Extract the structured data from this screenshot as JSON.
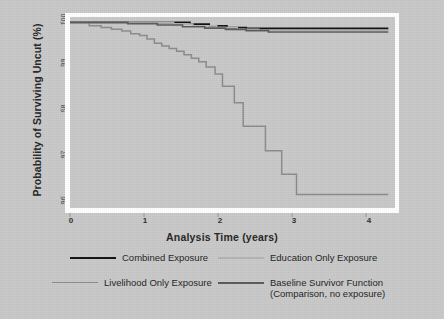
{
  "chart_data": {
    "type": "line",
    "title": "",
    "xlabel": "Analysis Time (years)",
    "ylabel": "Probability of Surviving Uncut (%)",
    "xlim": [
      0,
      4.35
    ],
    "ylim": [
      95.75,
      100.1
    ],
    "xticks": [
      "0",
      "1",
      "2",
      "3",
      "4"
    ],
    "xtick_values": [
      0,
      1,
      2,
      3,
      4
    ],
    "yticks": [
      "96",
      "97",
      "98",
      "99",
      "100"
    ],
    "ytick_values": [
      96,
      97,
      98,
      99,
      100
    ],
    "grid": false,
    "legend_position": "below",
    "step_style": "post",
    "series": [
      {
        "name": "Combined Exposure",
        "color": "#111111",
        "width": 1.8,
        "points": [
          [
            0.0,
            100.0
          ],
          [
            1.55,
            100.0
          ],
          [
            1.62,
            99.96
          ],
          [
            1.8,
            99.96
          ],
          [
            1.88,
            99.92
          ],
          [
            2.05,
            99.92
          ],
          [
            2.12,
            99.88
          ],
          [
            2.3,
            99.88
          ],
          [
            2.38,
            99.86
          ],
          [
            4.3,
            99.86
          ]
        ]
      },
      {
        "name": "Education Only Exposure",
        "color": "#b4b4b4",
        "width": 1.6,
        "points": [
          [
            0.0,
            100.0
          ],
          [
            1.3,
            100.0
          ],
          [
            1.4,
            99.96
          ],
          [
            1.58,
            99.96
          ],
          [
            1.66,
            99.92
          ],
          [
            1.9,
            99.92
          ],
          [
            1.98,
            99.88
          ],
          [
            2.18,
            99.88
          ],
          [
            2.26,
            99.84
          ],
          [
            2.45,
            99.84
          ],
          [
            2.55,
            99.82
          ],
          [
            4.3,
            99.82
          ]
        ]
      },
      {
        "name": "Livelihood Only Exposure",
        "color": "#8c8c8c",
        "width": 1.5,
        "points": [
          [
            0.12,
            100.0
          ],
          [
            0.22,
            100.0
          ],
          [
            0.26,
            99.92
          ],
          [
            0.38,
            99.92
          ],
          [
            0.42,
            99.88
          ],
          [
            0.52,
            99.88
          ],
          [
            0.56,
            99.84
          ],
          [
            0.66,
            99.84
          ],
          [
            0.7,
            99.8
          ],
          [
            0.78,
            99.8
          ],
          [
            0.82,
            99.74
          ],
          [
            0.9,
            99.74
          ],
          [
            0.94,
            99.7
          ],
          [
            1.0,
            99.7
          ],
          [
            1.04,
            99.62
          ],
          [
            1.1,
            99.62
          ],
          [
            1.14,
            99.52
          ],
          [
            1.2,
            99.52
          ],
          [
            1.24,
            99.46
          ],
          [
            1.3,
            99.46
          ],
          [
            1.34,
            99.4
          ],
          [
            1.4,
            99.4
          ],
          [
            1.44,
            99.34
          ],
          [
            1.5,
            99.34
          ],
          [
            1.54,
            99.26
          ],
          [
            1.6,
            99.26
          ],
          [
            1.64,
            99.18
          ],
          [
            1.7,
            99.18
          ],
          [
            1.74,
            99.1
          ],
          [
            1.8,
            99.1
          ],
          [
            1.84,
            98.98
          ],
          [
            1.92,
            98.98
          ],
          [
            1.96,
            98.82
          ],
          [
            2.02,
            98.82
          ],
          [
            2.06,
            98.54
          ],
          [
            2.18,
            98.54
          ],
          [
            2.22,
            98.16
          ],
          [
            2.3,
            98.16
          ],
          [
            2.34,
            97.62
          ],
          [
            2.6,
            97.62
          ],
          [
            2.64,
            97.06
          ],
          [
            2.82,
            97.06
          ],
          [
            2.86,
            96.52
          ],
          [
            3.02,
            96.52
          ],
          [
            3.06,
            96.06
          ],
          [
            4.3,
            96.06
          ]
        ]
      },
      {
        "name": "Baseline Survivor Function",
        "name_sub": "(Comparison, no exposure)",
        "color": "#5a5a5a",
        "width": 1.7,
        "points": [
          [
            0.0,
            100.0
          ],
          [
            0.7,
            100.0
          ],
          [
            0.78,
            99.97
          ],
          [
            1.1,
            99.97
          ],
          [
            1.18,
            99.94
          ],
          [
            1.44,
            99.94
          ],
          [
            1.52,
            99.9
          ],
          [
            1.74,
            99.9
          ],
          [
            1.82,
            99.87
          ],
          [
            2.02,
            99.87
          ],
          [
            2.1,
            99.84
          ],
          [
            2.3,
            99.84
          ],
          [
            2.38,
            99.81
          ],
          [
            2.6,
            99.81
          ],
          [
            2.68,
            99.78
          ],
          [
            4.3,
            99.78
          ]
        ]
      }
    ]
  },
  "legend": {
    "items": [
      {
        "label": "Combined Exposure",
        "sub": "",
        "color": "#111111"
      },
      {
        "label": "Education Only Exposure",
        "sub": "",
        "color": "#b4b4b4"
      },
      {
        "label": "Livelihood Only Exposure",
        "sub": "",
        "color": "#8c8c8c"
      },
      {
        "label": "Baseline Survivor Function",
        "sub": "(Comparison, no exposure)",
        "color": "#5a5a5a"
      }
    ]
  },
  "axes": {
    "x_title": "Analysis Time (years)",
    "y_title": "Probability of Surviving Uncut (%)",
    "x_tick_labels": [
      "0",
      "1",
      "2",
      "3",
      "4"
    ],
    "y_tick_labels": [
      "96",
      "97",
      "98",
      "99",
      "100"
    ]
  },
  "colors": {
    "background": "#c9c9c9",
    "plot_frame": "#ffffff",
    "text": "#1f1f1f"
  }
}
